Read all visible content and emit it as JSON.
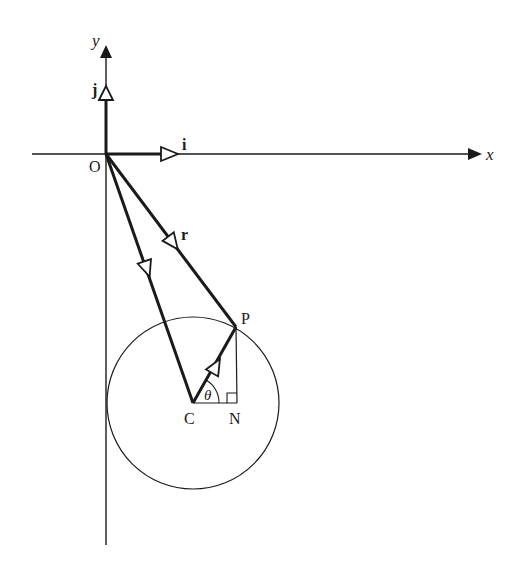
{
  "diagram": {
    "type": "vector-geometry",
    "colors": {
      "ink": "#1a1a1a",
      "background": "#ffffff"
    },
    "axes": {
      "x_label": "x",
      "y_label": "y",
      "origin_label": "O"
    },
    "unit_vectors": {
      "i_label": "i",
      "j_label": "j"
    },
    "points": {
      "O": "O",
      "P": "P",
      "C": "C",
      "N": "N"
    },
    "vectors": {
      "r_label": "r"
    },
    "angle_label": "θ",
    "elements": [
      "x-axis with arrow",
      "y-axis with arrow",
      "unit vector i along x-axis",
      "unit vector j along y-axis",
      "vector r from O to P",
      "vector from O to C",
      "vector from C to P",
      "circle centred at C through P",
      "right triangle C-N-P with right angle at N",
      "angle θ at C between CN and CP"
    ]
  }
}
